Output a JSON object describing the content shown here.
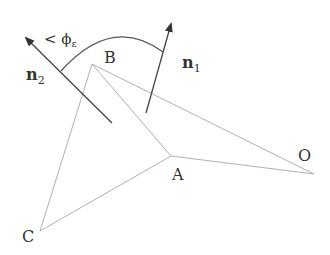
{
  "diagram": {
    "points": {
      "B": {
        "label": "B",
        "x": 92,
        "y": 64
      },
      "A": {
        "label": "A",
        "x": 171,
        "y": 156
      },
      "O": {
        "label": "O",
        "x": 314,
        "y": 174
      },
      "C": {
        "label": "C",
        "x": 40,
        "y": 231
      }
    },
    "vectors": {
      "n1": {
        "label": "n",
        "subscript": "1"
      },
      "n2": {
        "label": "n",
        "subscript": "2"
      }
    },
    "angle_label": {
      "prefix": "< ",
      "symbol": "ϕ",
      "subscript": "ε"
    },
    "colors": {
      "line": "#aaaaaa",
      "arrow": "#444444",
      "text": "#333333"
    }
  }
}
